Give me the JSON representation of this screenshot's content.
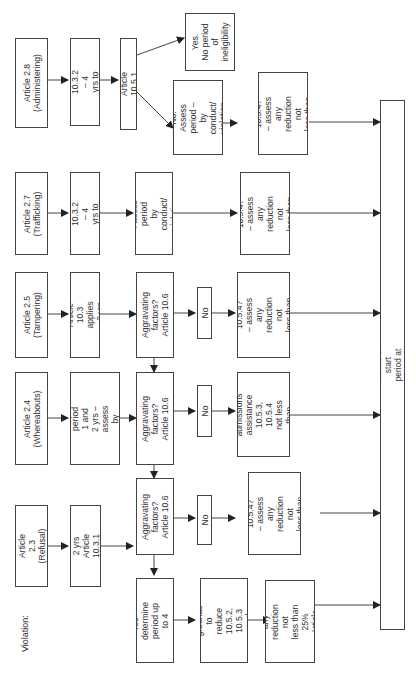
{
  "title": "Violation:",
  "violations": [
    {
      "label": "Article 2.3\n(Refusal)"
    },
    {
      "label": "Article 2.4\n(Whereabouts)"
    },
    {
      "label": "Article 2.5\n(Tampering)"
    },
    {
      "label": "Article 2.7\n(Trafficking)"
    },
    {
      "label": "Article 2.8\n(Administering)"
    }
  ],
  "periods": [
    {
      "label": "2 yrs\nArticle 10.3.1"
    },
    {
      "label": "Article 10.3.3\nperiod 1 and 2 yrs –\nassess by degree\nof fault"
    },
    {
      "label": "Article 10.3\napplies – 2 yrs"
    },
    {
      "label": "Article 10.3.2\n– 4 yrs to life"
    },
    {
      "label": "Article 10.3.2\n– 4 yrs to life"
    }
  ],
  "article_10_5_1": "Article 10.5.1",
  "yes_no_period": "Yes.\nNo period\nof\nineligibility",
  "no_assess": "No. Assess\nperiod – by\nconduct/\nviolation",
  "assess_trafficking": "Assess period\nby conduct/\nviolation",
  "aggravating": [
    "Aggravating\nfactors?\nArticle 10.6",
    "Aggravating\nfactors?\nArticle 10.6",
    "Aggravating\nfactors?\nArticle 10.6"
  ],
  "no_labels": [
    "No",
    "No",
    "No"
  ],
  "yes_determine": "Yes – determine\nperiod up to 4\nyrs",
  "grounds_reduce_yes": "Any grounds to\nreduce 10.5.2,\n10.5.3 and\n10.5.4",
  "assess_reduction_yes": "Assess any\nreduction not\nless than 25%\nArticle 10.5.5",
  "refusal_no_result": "Articles 10.5.2,\n10.5.3, 10.5.4?\n– assess any\nreduction not\nless than 25% –\nArticle 10.5.5",
  "whereabouts_no_result": "Any grounds to\nreduce\nadmissions\nassistance\n10.5.3, 10.5.4\nnot less than\n25% –\nArticle 10.5.5.",
  "tampering_no_result": "Articles 10.5.2,\n10.5.3, 10.5.4?\n– assess any\nreduction not\nless than 25%–\nArticle 10.5.5",
  "trafficking_result": "Articles 10.5.2,\n10.5.3, 10.5.4?\n– assess any\nreduction not\nless than 25% –\nArticle 10.5.5",
  "administering_result": "Articles 10.5.2,\n10.5.3, 10.5.4?\n– assess any\nreduction not\nless than 25% –\nArticle 10.5.5",
  "final": "Any reason not to disqualify results or start period at time of hearing – Articles 10.8 and 10.9",
  "colors": {
    "line": "#444444",
    "background": "#ffffff"
  }
}
